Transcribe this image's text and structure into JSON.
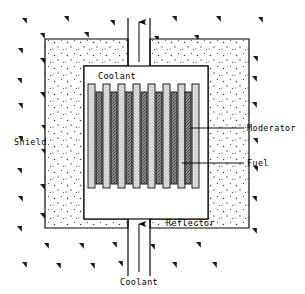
{
  "figure": {
    "type": "schematic-diagram",
    "width": 305,
    "height": 294,
    "background_color": "#ffffff",
    "line_color": "#000000"
  },
  "labels": {
    "shield": "Shield",
    "coolant_top": "Coolant",
    "coolant_bottom": "Coolant",
    "moderator": "Moderator",
    "fuel": "Fuel",
    "reflector": "Reflector"
  },
  "regions": {
    "shield": {
      "name": "Shield",
      "hatch_symbol": "triangle-flag",
      "fill_color": "#ffffff",
      "bounds": {
        "x": 45,
        "y": 31,
        "width": 204,
        "height": 197
      }
    },
    "reflector": {
      "name": "Reflector",
      "fill_pattern": "stipple-dots",
      "fill_color": "#ffffff",
      "dot_color": "#333333"
    },
    "core_vessel": {
      "name": "Core Vessel",
      "bounds": {
        "x": 84,
        "y": 66,
        "width": 124,
        "height": 153
      },
      "fill_color": "#ffffff"
    }
  },
  "coolant_flow": {
    "inlet_direction": "up",
    "outlet_direction": "up",
    "channel_width": 16,
    "arrow_color": "#000000"
  },
  "rods": {
    "moderator": {
      "label": "Moderator",
      "count": 8,
      "fill_color": "#d9d9d9",
      "pattern": "light-stipple",
      "width": 7,
      "height": 104,
      "top_y": 84
    },
    "fuel": {
      "label": "Fuel",
      "count": 7,
      "fill_color": "#9a9a9a",
      "pattern": "dark-crosshatch",
      "width": 6,
      "height": 92,
      "top_y": 92
    },
    "x_positions_moderator": [
      88,
      103,
      118,
      133,
      148,
      163,
      178,
      191
    ],
    "x_positions_fuel": [
      96,
      111,
      126,
      141,
      156,
      171,
      185
    ]
  },
  "leader_lines": {
    "moderator": {
      "from_x": 191,
      "from_y": 128,
      "to_x": 244,
      "to_y": 128
    },
    "fuel": {
      "from_x": 183,
      "from_y": 163,
      "to_x": 244,
      "to_y": 163
    }
  },
  "shield_marks_count": 44,
  "colors": {
    "stroke": "#000000",
    "moderator_fill": "#d9d9d9",
    "fuel_fill": "#9a9a9a",
    "stipple": "#444444"
  }
}
